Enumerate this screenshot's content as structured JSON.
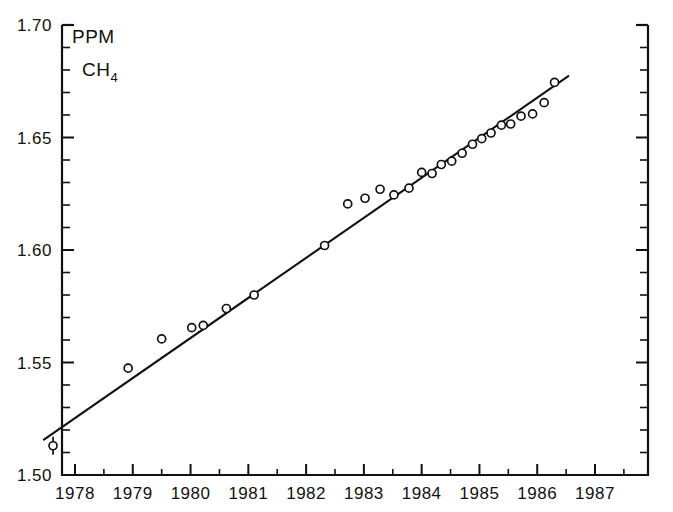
{
  "chart_data": {
    "type": "scatter",
    "title": "",
    "subtitle": "",
    "xlabel": "",
    "ylabel": "",
    "unit_annotation": "PPM",
    "species_annotation_base": "CH",
    "species_annotation_sub": "4",
    "xlim": [
      1977.4,
      1987.6
    ],
    "ylim": [
      1.5,
      1.7
    ],
    "grid": false,
    "legend": "none",
    "xticks": [
      1978,
      1979,
      1980,
      1981,
      1982,
      1983,
      1984,
      1985,
      1986,
      1987
    ],
    "xtick_labels": [
      "1978",
      "1979",
      "1980",
      "1981",
      "1982",
      "1983",
      "1984",
      "1985",
      "1986",
      "1987"
    ],
    "x_minor_tick_interval": 0.5,
    "yticks": [
      1.5,
      1.55,
      1.6,
      1.65,
      1.7
    ],
    "ytick_labels": [
      "1.50",
      "1.55",
      "1.60",
      "1.65",
      "1.70"
    ],
    "y_minor_tick_interval": 0.01,
    "marker_style": "open-circle",
    "error_bars": "vertical",
    "series": [
      {
        "name": "CH4 measurements",
        "x": [
          1977.62,
          1978.92,
          1979.5,
          1980.02,
          1980.22,
          1980.62,
          1981.1,
          1982.32,
          1982.72,
          1983.02,
          1983.28,
          1983.52,
          1983.78,
          1984.0,
          1984.18,
          1984.34,
          1984.52,
          1984.7,
          1984.88,
          1985.04,
          1985.2,
          1985.38,
          1985.54,
          1985.72,
          1985.92,
          1986.12,
          1986.3
        ],
        "y": [
          1.513,
          1.5475,
          1.5605,
          1.5655,
          1.5665,
          1.574,
          1.58,
          1.602,
          1.6205,
          1.623,
          1.627,
          1.6245,
          1.6275,
          1.6345,
          1.634,
          1.638,
          1.6395,
          1.643,
          1.647,
          1.6495,
          1.652,
          1.6555,
          1.656,
          1.6595,
          1.6605,
          1.6655,
          1.6745
        ],
        "yerr": [
          0.004,
          0.002,
          0.0018,
          0.0018,
          0.0018,
          0.0018,
          0.0018,
          0.0018,
          0.0018,
          0.0016,
          0.0016,
          0.0016,
          0.0016,
          0.0016,
          0.0016,
          0.0016,
          0.0016,
          0.0016,
          0.0016,
          0.0016,
          0.0016,
          0.0016,
          0.0016,
          0.0016,
          0.0016,
          0.0016,
          0.0016
        ]
      }
    ],
    "trend_line": {
      "name": "linear fit",
      "x_start": 1977.45,
      "y_start": 1.5155,
      "x_end": 1986.55,
      "y_end": 1.6775,
      "slope_per_year": 0.0178
    }
  }
}
